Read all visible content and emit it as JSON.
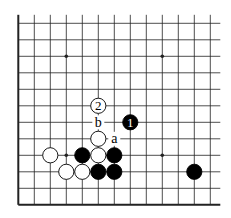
{
  "diagram": {
    "type": "go-board-fragment",
    "grid": {
      "columns": 13,
      "rows": 12,
      "origin_x": 18.3,
      "origin_y": 23.3,
      "spacing_x": 16.0,
      "spacing_y": 16.5,
      "open_top": true,
      "open_right": true,
      "left_edge": true,
      "bottom_edge": true
    },
    "star_points": [
      {
        "col": 3,
        "row": 2
      },
      {
        "col": 9,
        "row": 2
      },
      {
        "col": 3,
        "row": 8
      },
      {
        "col": 9,
        "row": 8
      }
    ],
    "stones": [
      {
        "col": 5,
        "row": 5,
        "color": "white",
        "label": "2"
      },
      {
        "col": 7,
        "row": 6,
        "color": "black",
        "label": "1"
      },
      {
        "col": 5,
        "row": 7,
        "color": "white",
        "label": ""
      },
      {
        "col": 2,
        "row": 8,
        "color": "white",
        "label": ""
      },
      {
        "col": 4,
        "row": 8,
        "color": "black",
        "label": ""
      },
      {
        "col": 5,
        "row": 8,
        "color": "white",
        "label": ""
      },
      {
        "col": 6,
        "row": 8,
        "color": "black",
        "label": ""
      },
      {
        "col": 3,
        "row": 9,
        "color": "white",
        "label": ""
      },
      {
        "col": 4,
        "row": 9,
        "color": "white",
        "label": ""
      },
      {
        "col": 5,
        "row": 9,
        "color": "black",
        "label": ""
      },
      {
        "col": 6,
        "row": 9,
        "color": "black",
        "label": ""
      },
      {
        "col": 11,
        "row": 9,
        "color": "black",
        "label": ""
      }
    ],
    "point_labels": [
      {
        "col": 5,
        "row": 6,
        "text": "b"
      },
      {
        "col": 6,
        "row": 7,
        "text": "a"
      }
    ],
    "colors": {
      "line": "#222222",
      "black_stone": "#000000",
      "white_stone": "#ffffff",
      "background": "#ffffff"
    }
  }
}
